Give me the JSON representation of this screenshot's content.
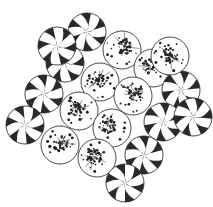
{
  "figure": {
    "background_color": "#ffffff",
    "ink_color": "#1a1a1a",
    "width": 213,
    "height": 207
  },
  "top_text_strip": {
    "visible": true,
    "note": "faint clipped row of text at very top of scan",
    "fragments": [
      "— — —— ——",
      "—   — —  —",
      "—— —  —"
    ]
  },
  "legend": {
    "pinwheel_label": "pinwheel circle",
    "speckled_label": "speckled circle"
  },
  "chart_data": {
    "type": "scatter",
    "xlabel": "",
    "ylabel": "",
    "xlim": [
      0,
      213
    ],
    "ylim": [
      0,
      207
    ],
    "grid": false,
    "legend_position": "none",
    "circle_radius": 19,
    "styles": [
      "pinwheel",
      "speckled"
    ],
    "wedge_count": 12,
    "circles": [
      {
        "id": 1,
        "cx": 87,
        "cy": 32,
        "r": 19,
        "style": "pinwheel",
        "rotation": 12
      },
      {
        "id": 2,
        "cx": 122,
        "cy": 50,
        "r": 19,
        "style": "speckled",
        "rotation": 0
      },
      {
        "id": 3,
        "cx": 65,
        "cy": 63,
        "r": 19,
        "style": "pinwheel",
        "rotation": 40
      },
      {
        "id": 4,
        "cx": 100,
        "cy": 82,
        "r": 19,
        "style": "speckled",
        "rotation": 0
      },
      {
        "id": 5,
        "cx": 153,
        "cy": 68,
        "r": 19,
        "style": "speckled",
        "rotation": 0
      },
      {
        "id": 6,
        "cx": 44,
        "cy": 94,
        "r": 19,
        "style": "pinwheel",
        "rotation": 70
      },
      {
        "id": 7,
        "cx": 133,
        "cy": 96,
        "r": 19,
        "style": "speckled",
        "rotation": 0
      },
      {
        "id": 8,
        "cx": 181,
        "cy": 90,
        "r": 19,
        "style": "pinwheel",
        "rotation": 25
      },
      {
        "id": 9,
        "cx": 79,
        "cy": 111,
        "r": 19,
        "style": "speckled",
        "rotation": 0
      },
      {
        "id": 10,
        "cx": 25,
        "cy": 125,
        "r": 19,
        "style": "pinwheel",
        "rotation": 55
      },
      {
        "id": 11,
        "cx": 112,
        "cy": 128,
        "r": 19,
        "style": "speckled",
        "rotation": 0
      },
      {
        "id": 12,
        "cx": 163,
        "cy": 122,
        "r": 19,
        "style": "pinwheel",
        "rotation": 80
      },
      {
        "id": 13,
        "cx": 60,
        "cy": 145,
        "r": 19,
        "style": "speckled",
        "rotation": 0
      },
      {
        "id": 14,
        "cx": 144,
        "cy": 155,
        "r": 19,
        "style": "pinwheel",
        "rotation": 15
      },
      {
        "id": 15,
        "cx": 97,
        "cy": 158,
        "r": 19,
        "style": "speckled",
        "rotation": 0
      },
      {
        "id": 16,
        "cx": 125,
        "cy": 183,
        "r": 19,
        "style": "pinwheel",
        "rotation": 60
      },
      {
        "id": 17,
        "cx": 193,
        "cy": 117,
        "r": 19,
        "style": "pinwheel",
        "rotation": 35
      },
      {
        "id": 18,
        "cx": 57,
        "cy": 46,
        "r": 19,
        "style": "pinwheel",
        "rotation": 48
      },
      {
        "id": 19,
        "cx": 170,
        "cy": 56,
        "r": 19,
        "style": "speckled",
        "rotation": 0
      }
    ]
  }
}
